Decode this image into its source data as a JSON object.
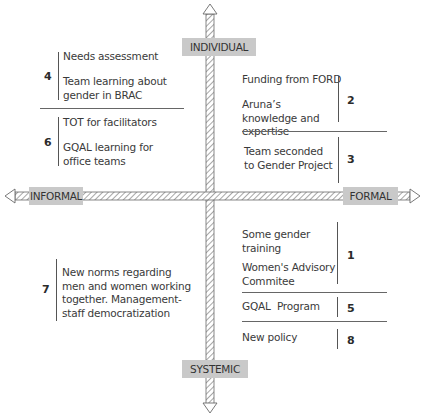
{
  "axes": {
    "top": "INDIVIDUAL",
    "bottom": "SYSTEMIC",
    "left": "INFORMAL",
    "right": "FORMAL"
  },
  "quadrants": {
    "individual_informal": [
      {
        "number": "4",
        "items": [
          "Needs assessment",
          "Team learning about gender in BRAC"
        ]
      },
      {
        "number": "6",
        "items": [
          "TOT  for facilitators",
          "GQAL learning for office teams"
        ]
      }
    ],
    "individual_formal": [
      {
        "number": "2",
        "items": [
          "Funding from FORD",
          "Aruna’s knowledge and expertise"
        ]
      },
      {
        "number": "3",
        "items": [
          "Team seconded to Gender Project"
        ]
      }
    ],
    "systemic_informal": [
      {
        "number": "7",
        "items": [
          "New norms regarding men and women working together. Management-staff democratization"
        ]
      }
    ],
    "systemic_formal": [
      {
        "number": "1",
        "items": [
          "Some gender training",
          "Women's Advisory Commitee"
        ]
      },
      {
        "number": "5",
        "items": [
          "GQAL  Program"
        ]
      },
      {
        "number": "8",
        "items": [
          "New policy"
        ]
      }
    ]
  },
  "colors": {
    "label_box": "#c9c9c9",
    "axis_stroke": "#6a6a6a",
    "text": "#3a3a3a"
  }
}
